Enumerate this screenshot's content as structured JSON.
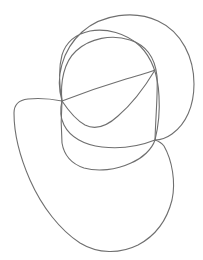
{
  "document": {
    "kind": "line-drawing",
    "title": "Abstract continuous line doodle",
    "description": "Three overlapping hand-drawn closed loops forming a knot-like abstract figure",
    "width": 203,
    "height": 260
  },
  "canvas": {
    "background_color": "#ffffff",
    "stroke_color": "#6f6f6f",
    "stroke_width": 1.1,
    "view_box": "0 0 203 260"
  },
  "junctions": [
    {
      "name": "left-junction",
      "x": 62,
      "y": 101,
      "strand_count": 5
    },
    {
      "name": "right-junction",
      "x": 155,
      "y": 140,
      "strand_count": 4
    }
  ],
  "shapes": [
    {
      "name": "outer-upper-loop",
      "label": "Large upper loop",
      "path": "M 62 101 C 55 78 62 50 82 32 C 102 14 135 10 158 21 C 182 32 194 58 194 84 C 194 106 186 124 172 134 C 165 139 159 140 155 140 C 158 128 160 112 159 96 C 158 74 152 58 140 46 C 126 33 106 28 90 31 C 76 34 66 42 62 55 C 59 66 59 84 62 101 Z"
    },
    {
      "name": "inner-middle-loop",
      "label": "Middle inner loop",
      "path": "M 62 101 C 60 82 64 62 76 51 C 90 38 112 34 130 40 C 146 45 155 58 157 76 C 158 92 156 110 155 140 C 140 146 120 149 102 147 C 84 145 70 137 64 125 C 60 117 60 109 62 101 Z"
    },
    {
      "name": "outer-lower-loop",
      "label": "Lower outer loop",
      "path": "M 62 101 C 52 99 38 98 28 99 C 19 100 14 104 14 113 C 14 130 19 155 30 180 C 42 207 60 230 80 243 C 98 254 120 254 138 245 C 155 236 167 220 172 200 C 176 182 172 160 164 146 C 161 142 158 141 155 140 C 152 149 143 158 131 163 C 116 170 98 172 84 168 C 72 164 64 155 62 143 C 61 130 61 114 62 101 Z"
    },
    {
      "name": "leaf-chord-upper",
      "label": "Upper diagonal chord of leaf shape",
      "path": "M 62 101 C 80 94 106 85 126 79 C 140 75 150 72 155 70"
    },
    {
      "name": "leaf-chord-lower",
      "label": "Lower curved chord of leaf shape",
      "path": "M 62 101 C 68 110 76 120 85 125 C 95 130 106 127 118 116 C 132 104 146 85 155 70"
    }
  ]
}
